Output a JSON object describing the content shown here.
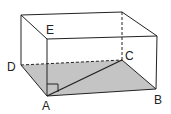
{
  "diagram": {
    "type": "rectangular-box (cuboid) geometry figure",
    "colors": {
      "line": "#222222",
      "shade": "#c4c4c4",
      "background": "#ffffff"
    },
    "labels": {
      "A": "A",
      "B": "B",
      "C": "C",
      "D": "D",
      "E": "E"
    },
    "shaded_region": "bottom face D-A-B-C",
    "segments": [
      "AC (diagonal of base)",
      "AE (vertical edge)"
    ],
    "marks": [
      "right angle at A between AE and base"
    ],
    "hidden_edges_dashed": [
      "D-C",
      "C-top back right vertical"
    ]
  }
}
